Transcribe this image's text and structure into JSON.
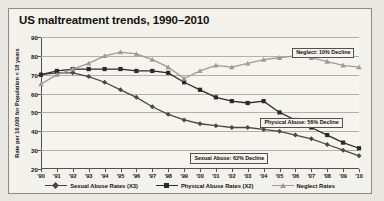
{
  "figure": {
    "title": "US maltreatment trends, 1990–2010"
  },
  "chart_data": {
    "type": "line",
    "title": "US maltreatment trends, 1990–2010",
    "xlabel": "",
    "ylabel": "Rate per 10,000 for Population < 18 years",
    "ylim": [
      20,
      90
    ],
    "yticks": [
      20,
      30,
      40,
      50,
      60,
      70,
      80,
      90
    ],
    "grid": true,
    "legend_position": "bottom",
    "x": [
      "'90",
      "'91",
      "'92",
      "'93",
      "'94",
      "'95",
      "'96",
      "'97",
      "'98",
      "'99",
      "'00",
      "'01",
      "'02",
      "'03",
      "'04",
      "'05",
      "'06",
      "'07",
      "'08",
      "'09",
      "'10"
    ],
    "series": [
      {
        "name": "Sexual Abuse Rates (X3)",
        "marker": "diamond",
        "color": "#4a4845",
        "values": [
          70,
          71,
          71,
          69,
          66,
          62,
          58,
          53,
          49,
          46,
          44,
          43,
          42,
          42,
          41,
          40,
          38,
          36,
          33,
          30,
          27
        ]
      },
      {
        "name": "Physical Abuse Rates (X2)",
        "marker": "square",
        "color": "#2b2a28",
        "values": [
          70,
          72,
          73,
          73,
          73,
          73,
          72,
          72,
          71,
          66,
          62,
          58,
          56,
          55,
          56,
          50,
          46,
          42,
          38,
          34,
          31
        ]
      },
      {
        "name": "Neglect Rates",
        "marker": "triangle",
        "color": "#9e9b94",
        "values": [
          65,
          70,
          73,
          76,
          80,
          82,
          81,
          78,
          74,
          68,
          72,
          75,
          74,
          76,
          78,
          79,
          80,
          79,
          77,
          75,
          74
        ]
      }
    ],
    "annotations": [
      {
        "text": "Neglect: 10% Decline",
        "x_pct": 79,
        "y_pct": 8
      },
      {
        "text": "Physical Abuse: 56% Decline",
        "x_pct": 69,
        "y_pct": 61
      },
      {
        "text": "Sexual Abuse: 62% Decline",
        "x_pct": 47,
        "y_pct": 88
      }
    ]
  }
}
